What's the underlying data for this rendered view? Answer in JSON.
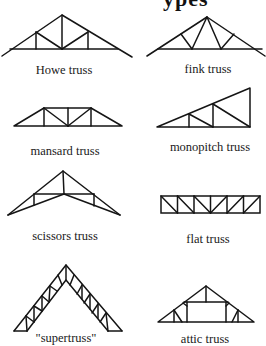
{
  "page": {
    "title_fragment": "ypes"
  },
  "trusses": [
    {
      "id": "howe",
      "label": "Howe truss"
    },
    {
      "id": "fink",
      "label": "fink truss"
    },
    {
      "id": "mansard",
      "label": "mansard truss"
    },
    {
      "id": "monopitch",
      "label": "monopitch truss"
    },
    {
      "id": "scissors",
      "label": "scissors truss"
    },
    {
      "id": "flat",
      "label": "flat truss"
    },
    {
      "id": "supertruss",
      "label": "\"supertruss\""
    },
    {
      "id": "attic",
      "label": "attic truss"
    }
  ],
  "colors": {
    "background": "#ffffff",
    "ink": "#151515"
  }
}
